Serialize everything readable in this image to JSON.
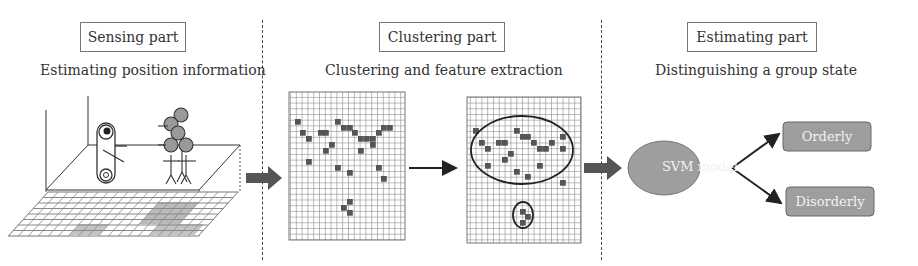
{
  "sections": [
    {
      "title": "Sensing part",
      "subtitle": "Estimating position information"
    },
    {
      "title": "Clustering part",
      "subtitle": "Clustering and feature extraction"
    },
    {
      "title": "Estimating part",
      "subtitle": "Distinguishing a group state"
    }
  ],
  "svm": {
    "model_label": "SVM model",
    "outputs": [
      "Orderly",
      "Disorderly"
    ]
  },
  "colors": {
    "accent_gray": "#9e9e9e",
    "arrow": "#555555",
    "grid_line": "#777777",
    "cell_fill": "#555555"
  }
}
